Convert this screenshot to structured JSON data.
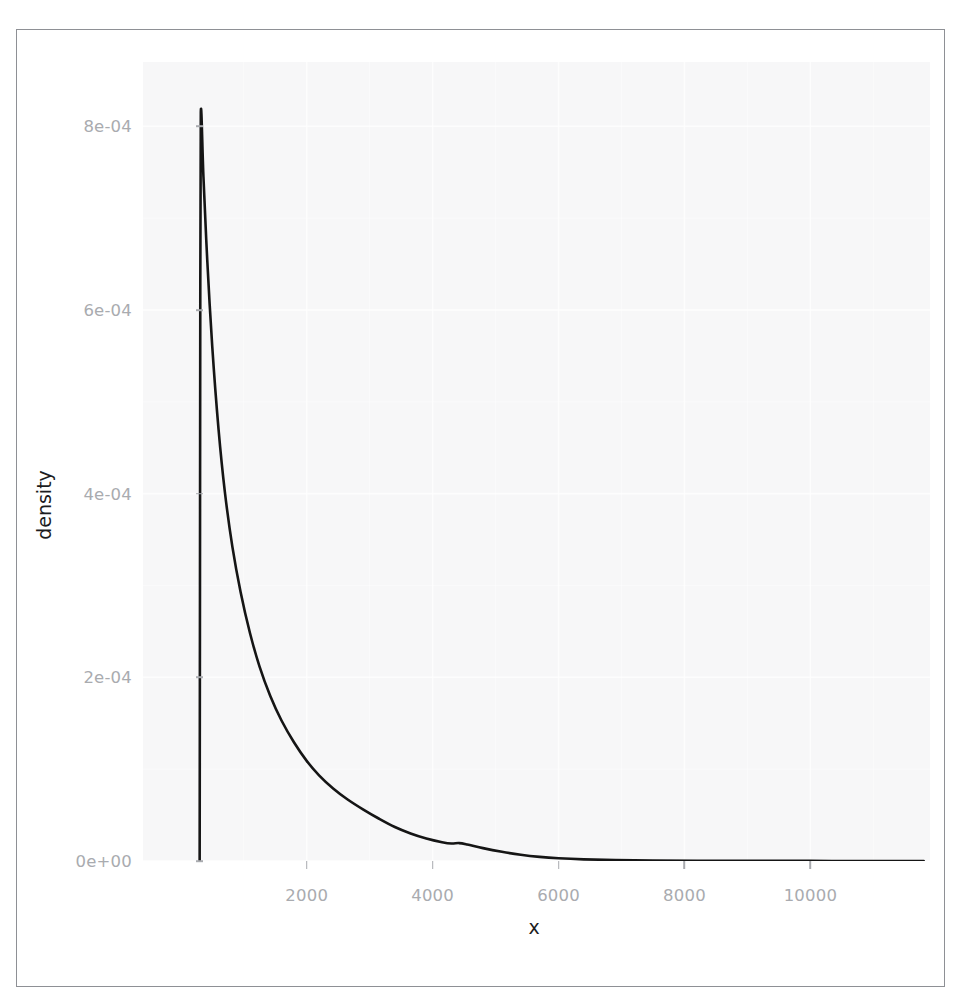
{
  "chart_data": {
    "type": "line",
    "title": "",
    "subtitle": "",
    "xlabel": "x",
    "ylabel": "density",
    "xlim": [
      -600,
      11900
    ],
    "ylim": [
      0,
      0.00087
    ],
    "grid": true,
    "legend": null,
    "x_ticks": [
      2000,
      4000,
      6000,
      8000,
      10000
    ],
    "x_tick_labels": [
      "2000",
      "4000",
      "6000",
      "8000",
      "10000"
    ],
    "y_ticks": [
      0,
      0.0002,
      0.0004,
      0.0006,
      0.0008
    ],
    "y_tick_labels": [
      "0e+00",
      "2e-04",
      "4e-04",
      "6e-04",
      "8e-04"
    ],
    "series": [
      {
        "name": "density",
        "color": "#151515",
        "points": [
          [
            300,
            0.0
          ],
          [
            305,
            0.0003
          ],
          [
            310,
            0.00062
          ],
          [
            318,
            0.000815
          ],
          [
            360,
            0.000745
          ],
          [
            420,
            0.000655
          ],
          [
            500,
            0.00056
          ],
          [
            600,
            0.00047
          ],
          [
            700,
            0.000402
          ],
          [
            820,
            0.000342
          ],
          [
            950,
            0.000293
          ],
          [
            1100,
            0.000248
          ],
          [
            1250,
            0.000212
          ],
          [
            1420,
            0.00018
          ],
          [
            1600,
            0.000153
          ],
          [
            1800,
            0.000129
          ],
          [
            2000,
            0.000109
          ],
          [
            2200,
            9.3e-05
          ],
          [
            2420,
            7.9e-05
          ],
          [
            2650,
            6.7e-05
          ],
          [
            2900,
            5.6e-05
          ],
          [
            3150,
            4.6e-05
          ],
          [
            3400,
            3.7e-05
          ],
          [
            3650,
            3e-05
          ],
          [
            3900,
            2.45e-05
          ],
          [
            4150,
            2.05e-05
          ],
          [
            4300,
            1.9e-05
          ],
          [
            4420,
            1.95e-05
          ],
          [
            4550,
            1.8e-05
          ],
          [
            4800,
            1.4e-05
          ],
          [
            5100,
            1e-05
          ],
          [
            5400,
            6.8e-06
          ],
          [
            5700,
            4.5e-06
          ],
          [
            6000,
            3e-06
          ],
          [
            6400,
            1.8e-06
          ],
          [
            6900,
            1e-06
          ],
          [
            7500,
            6e-07
          ],
          [
            8200,
            3e-07
          ],
          [
            9000,
            2e-07
          ],
          [
            10000,
            1e-07
          ],
          [
            11000,
            0.0
          ],
          [
            11800,
            0.0
          ]
        ]
      }
    ],
    "baseline_note": "curve rises vertically from zero at the left limit to the mode, then decays with a small shoulder near x = 4400"
  },
  "axes": {
    "y_title": "density",
    "x_title": "x"
  }
}
